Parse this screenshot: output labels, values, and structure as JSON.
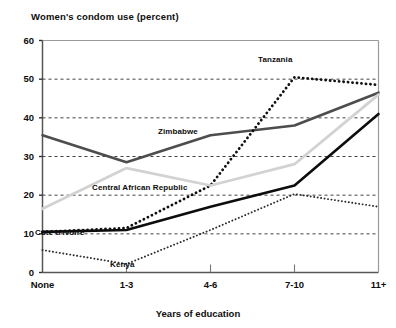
{
  "chart_data": {
    "type": "line",
    "title": "Women's condom use (percent)",
    "xlabel": "Years of education",
    "ylabel": "",
    "categories": [
      "None",
      "1-3",
      "4-6",
      "7-10",
      "11+"
    ],
    "ylim": [
      0,
      60
    ],
    "yticks": [
      0,
      10,
      20,
      30,
      40,
      50,
      60
    ],
    "ytick_labels": [
      "0",
      "10",
      "20",
      "30",
      "40",
      "50",
      "60"
    ],
    "grid": "horizontal-dashed",
    "legend": "inline-labels",
    "series": [
      {
        "name": "Zimbabwe",
        "values": [
          35.5,
          28.5,
          35.5,
          38.0,
          46.5
        ],
        "color": "#4d4d4d",
        "style": "solid",
        "width": 2.6,
        "label_x": 158,
        "label_y": 127
      },
      {
        "name": "Tanzania",
        "values": [
          10.5,
          11.5,
          22.5,
          50.5,
          48.5
        ],
        "color": "#111111",
        "style": "dotted-bold",
        "width": 2.8,
        "label_x": 258,
        "label_y": 55
      },
      {
        "name": "Central African Republic",
        "values": [
          16.5,
          27.0,
          22.5,
          28.0,
          46.0
        ],
        "color": "#d2d2d2",
        "style": "solid",
        "width": 2.8,
        "label_x": 92,
        "label_y": 183
      },
      {
        "name": "Côte d'Ivoire",
        "values": [
          10.5,
          11.0,
          17.0,
          22.5,
          41.0
        ],
        "color": "#0d0d0d",
        "style": "solid",
        "width": 2.6,
        "label_x": 35,
        "label_y": 228
      },
      {
        "name": "Kenya",
        "values": [
          5.8,
          2.2,
          11.0,
          20.3,
          17.0
        ],
        "color": "#2b2b2b",
        "style": "dotted-fine",
        "width": 1.9,
        "label_x": 110,
        "label_y": 260
      }
    ]
  }
}
